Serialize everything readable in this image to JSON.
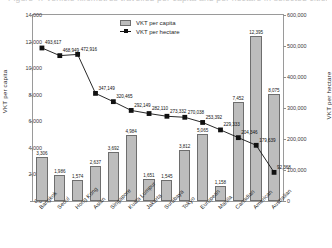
{
  "top_caption": "Figure 4. Vehicle kilometres travelled per capita and per hectare in selected cities",
  "legend": {
    "position": "top-center",
    "entries": [
      {
        "label": "VKT per capita",
        "marker": "bar-swatch",
        "color": "#bdbdbd"
      },
      {
        "label": "VKT per hectare",
        "marker": "line-square",
        "color": "#111111"
      }
    ]
  },
  "axes": {
    "left_title": "VKT per capita",
    "right_title": "VKT per hectare",
    "left_ticks": [
      "0.0",
      "2,000",
      "4,000",
      "6,000",
      "8,000",
      "10,000",
      "12,000",
      "14,000"
    ],
    "right_ticks": [
      "0",
      "100,000",
      "200,000",
      "300,000",
      "400,000",
      "500,000",
      "600,000"
    ]
  },
  "chart_data": {
    "type": "bar",
    "title": "",
    "xlabel": "",
    "ylabel": "VKT per capita",
    "y2label": "VKT per hectare",
    "ylim": [
      0,
      14000
    ],
    "y2lim": [
      0,
      600000
    ],
    "grid": false,
    "legend_position": "top-center",
    "categories": [
      "Bangkok",
      "Seoul",
      "Hong Kong",
      "Asian",
      "Singapore",
      "Kuala Lumpur",
      "Jakarta",
      "Surabaya",
      "Tokyo",
      "European",
      "Manila",
      "Canadian",
      "American",
      "Australian"
    ],
    "series": [
      {
        "name": "VKT per capita",
        "type": "bar",
        "axis": "left",
        "color": "#bdbdbd",
        "values": [
          3306,
          1986,
          1574,
          2637,
          3692,
          4984,
          1651,
          1545,
          3812,
          5065,
          1158,
          7452,
          12395,
          8075
        ],
        "value_labels": [
          "3,306",
          "1,986",
          "1,574",
          "2,637",
          "3,692",
          "4,984",
          "1,651",
          "1,545",
          "3,812",
          "5,065",
          "1,158",
          "7,452",
          "12,395",
          "8,075"
        ]
      },
      {
        "name": "VKT per hectare",
        "type": "line",
        "axis": "right",
        "color": "#111111",
        "marker": "square",
        "values": [
          493617,
          468949,
          472916,
          347149,
          320465,
          292149,
          282110,
          273332,
          270038,
          253392,
          229333,
          204346,
          179639,
          92368
        ],
        "value_labels": [
          "493,617",
          "468,949",
          "472,916",
          "347,149",
          "320,465",
          "292,149",
          "282,110",
          "273,332",
          "270,038",
          "253,392",
          "229,333",
          "204,346",
          "179,639",
          "92,368"
        ]
      }
    ]
  }
}
